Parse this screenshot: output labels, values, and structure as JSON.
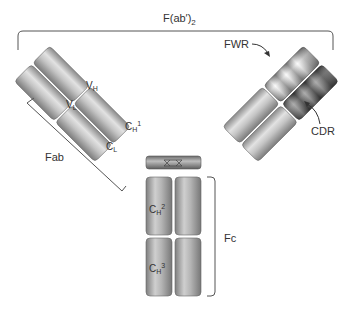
{
  "diagram": {
    "labels": {
      "fab2": "F(ab′)",
      "fab2_sub": "2",
      "fab": "Fab",
      "fc": "Fc",
      "fwr": "FWR",
      "cdr": "CDR",
      "vh": "V",
      "vh_sub": "H",
      "vl": "V",
      "vl_sub": "L",
      "ch1": "C",
      "ch1_sub": "H",
      "ch1_sup": "1",
      "cl": "C",
      "cl_sub": "L",
      "ch2": "C",
      "ch2_sub": "H",
      "ch2_sup": "2",
      "ch3": "C",
      "ch3_sub": "H",
      "ch3_sup": "3"
    },
    "colors": {
      "domain_light": "#d8d8d8",
      "domain_mid": "#a8a8a8",
      "domain_dark": "#7a7a7a",
      "cdr_dark": "#4a4a4a",
      "fwr_light": "#f2f2f2",
      "line": "#555555"
    }
  }
}
